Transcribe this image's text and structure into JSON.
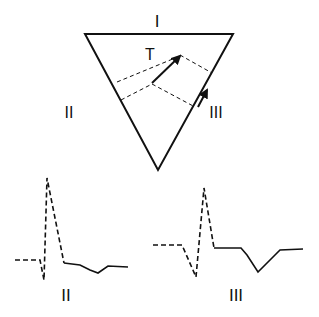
{
  "diagram": {
    "lead_labels": {
      "top": "I",
      "left": "II",
      "right": "III",
      "vector": "T"
    },
    "waveform_labels": {
      "left": "II",
      "right": "III"
    },
    "stroke_color": "#111111"
  }
}
